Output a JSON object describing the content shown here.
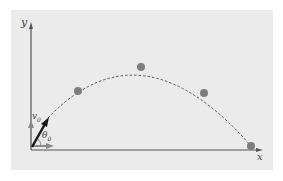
{
  "diagram": {
    "type": "projectile-motion",
    "axes": {
      "x_label": "x",
      "y_label": "y"
    },
    "launch": {
      "velocity_label": "v0",
      "angle_label": "θ0"
    },
    "labels": {
      "y": "y",
      "x": "x",
      "v": "v",
      "v_sub": "0",
      "theta": "θ",
      "theta_sub": "0"
    },
    "points": [
      {
        "x": 78,
        "y": 91
      },
      {
        "x": 141,
        "y": 67
      },
      {
        "x": 204,
        "y": 93
      },
      {
        "x": 251,
        "y": 146
      }
    ],
    "colors": {
      "panel": "#ebebeb",
      "axis": "#555555",
      "point": "#7d7d7d",
      "vector": "#1a1a1a",
      "component": "#8a8a8a"
    }
  }
}
